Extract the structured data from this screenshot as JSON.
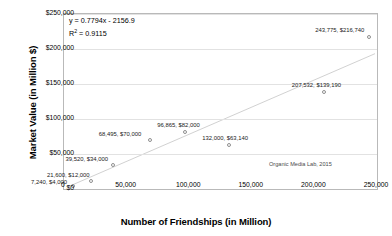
{
  "chart_data": {
    "type": "scatter",
    "title": "",
    "xlabel": "Number of Friendships (in Million)",
    "ylabel": "Market Value (in Million $)",
    "xlim": [
      0,
      250000
    ],
    "ylim": [
      0,
      250000
    ],
    "x_ticks": [
      "0",
      "50,000",
      "100,000",
      "150,000",
      "200,000",
      "250,000"
    ],
    "x_tick_values": [
      0,
      50000,
      100000,
      150000,
      200000,
      250000
    ],
    "y_ticks": [
      "$0",
      "$50,000",
      "$100,000",
      "$150,000",
      "$200,000",
      "$250,000"
    ],
    "y_tick_values": [
      0,
      50000,
      100000,
      150000,
      200000,
      250000
    ],
    "grid": true,
    "legend": "none",
    "points": [
      {
        "x": 7240,
        "y": 4000,
        "label": "7,240, $4,000",
        "label_dx": -42,
        "label_dy": -7
      },
      {
        "x": 21600,
        "y": 12000,
        "label": "21,600, $12,000",
        "label_dx": -44,
        "label_dy": -9
      },
      {
        "x": 39520,
        "y": 34000,
        "label": "39,520, $34,000",
        "label_dx": -48,
        "label_dy": -9
      },
      {
        "x": 68495,
        "y": 70000,
        "label": "68,495, $70,000",
        "label_dx": -51,
        "label_dy": -9
      },
      {
        "x": 96865,
        "y": 82000,
        "label": "96,865, $82,000",
        "label_dx": -28,
        "label_dy": -10
      },
      {
        "x": 132000,
        "y": 63140,
        "label": "132,000, $63,140",
        "label_dx": -27,
        "label_dy": -10
      },
      {
        "x": 207532,
        "y": 139190,
        "label": "207,532, $139,190",
        "label_dx": -32,
        "label_dy": -10
      },
      {
        "x": 243775,
        "y": 216740,
        "label": "243,775, $216,740",
        "label_dx": -54,
        "label_dy": -10
      }
    ],
    "trendline": {
      "slope": 0.7794,
      "intercept": -2156.9,
      "equation": "y = 0.7794x - 2156.9",
      "r_squared_label": "R",
      "r_squared_sup": "2",
      "r_squared_value": " = 0.9115"
    },
    "annotation": "Organic Media Lab, 2015",
    "marker_color": "#8f8f8f",
    "trend_color": "#d0d0d0",
    "grid_color": "#e2e2e2",
    "frame_color": "#b9b9b9"
  }
}
